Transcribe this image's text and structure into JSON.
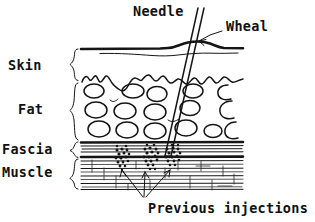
{
  "figure": {
    "style": "hand-drawn line art, black ink on white",
    "ink_color": "#151515",
    "background_color": "#ffffff"
  },
  "layer_labels": [
    {
      "id": "skin",
      "text": "Skin",
      "x": 8,
      "y": 70,
      "brace_top": 50,
      "brace_bottom": 81
    },
    {
      "id": "fat",
      "text": "Fat",
      "x": 18,
      "y": 110,
      "brace_top": 83,
      "brace_bottom": 140
    },
    {
      "id": "fascia",
      "text": "Fascia",
      "x": 2,
      "y": 152,
      "brace_top": 142,
      "brace_bottom": 158
    },
    {
      "id": "muscle",
      "text": "Muscle",
      "x": 2,
      "y": 172,
      "brace_top": 159,
      "brace_bottom": 188
    }
  ],
  "callouts": [
    {
      "id": "needle",
      "text": "Needle",
      "x": 133,
      "y": 16
    },
    {
      "id": "wheal",
      "text": "Wheal",
      "x": 225,
      "y": 31
    }
  ],
  "footnote": {
    "id": "previous-injections",
    "text": "Previous injections",
    "x": 146,
    "y": 212
  },
  "anatomy": {
    "skin_surface_label": "epidermis outer line",
    "fat_cells_rows": 3,
    "fat_cells_count": 19,
    "fascia_line_count": 5,
    "muscle_striation_count": 9,
    "injection_cluster_count": 3,
    "arrow_count": 3
  },
  "needle": {
    "top_x": 201,
    "top_y": 8,
    "tip_x": 168,
    "tip_y": 156,
    "width": 5
  }
}
